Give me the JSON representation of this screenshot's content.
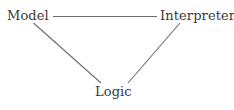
{
  "diagram": {
    "type": "triangle-relationship-diagram",
    "background_color": "#ffffff",
    "text_color": "#3a3a3a",
    "edge_color": "#6e6e6e",
    "nodes": [
      {
        "id": "model",
        "label": "Model",
        "position": "top-left"
      },
      {
        "id": "interpreter",
        "label": "Interpreter",
        "position": "top-right"
      },
      {
        "id": "logic",
        "label": "Logic",
        "position": "bottom-center"
      }
    ],
    "edges": [
      {
        "id": "model-interpreter",
        "from": "Model",
        "to": "Interpreter",
        "style": "straight-horizontal"
      },
      {
        "id": "model-logic",
        "from": "Model",
        "to": "Logic",
        "style": "straight-diagonal"
      },
      {
        "id": "interpreter-logic",
        "from": "Interpreter",
        "to": "Logic",
        "style": "straight-diagonal"
      }
    ]
  }
}
